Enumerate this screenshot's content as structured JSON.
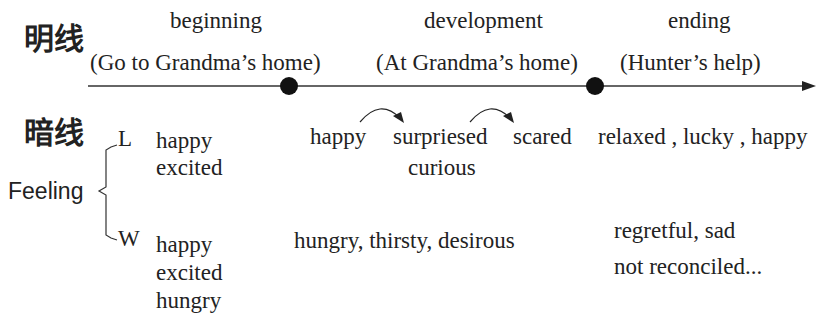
{
  "labels": {
    "main_line": "明线",
    "hidden_line": "暗线",
    "feeling": "Feeling",
    "branch_l": "L",
    "branch_w": "W"
  },
  "timeline": {
    "stages": [
      {
        "name": "beginning",
        "desc": "(Go to Grandma’s home)"
      },
      {
        "name": "development",
        "desc": "(At Grandma’s home)"
      },
      {
        "name": "ending",
        "desc": "(Hunter’s help)"
      }
    ]
  },
  "feelings": {
    "L": {
      "beginning": [
        "happy",
        "excited"
      ],
      "development": {
        "first": "happy",
        "second": "surpriesed",
        "second_sub": "curious",
        "third": "scared"
      },
      "ending": "relaxed , lucky , happy"
    },
    "W": {
      "beginning": [
        "happy",
        "excited",
        "hungry"
      ],
      "development": "hungry, thirsty, desirous",
      "ending": [
        "regretful, sad",
        "not reconciled..."
      ]
    }
  },
  "colors": {
    "ink": "#222222",
    "line": "#333333",
    "dot": "#111111"
  }
}
